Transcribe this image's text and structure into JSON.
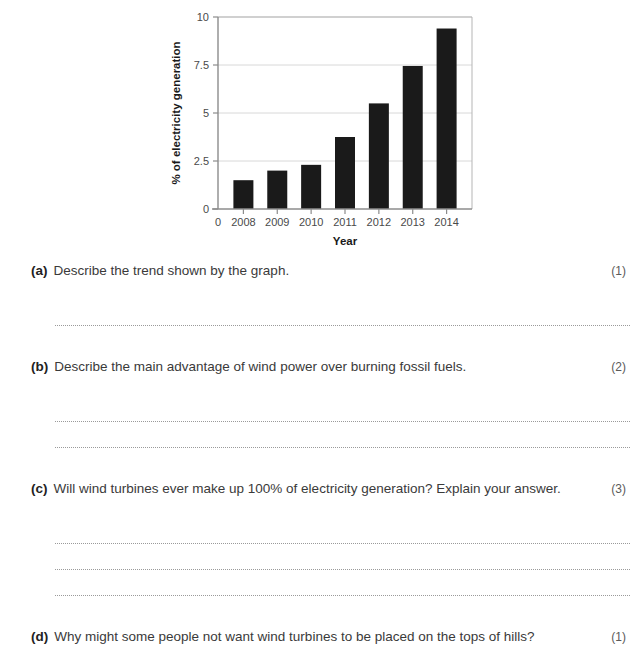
{
  "chart_data": {
    "type": "bar",
    "title": "",
    "xlabel": "Year",
    "ylabel": "% of electricity generation",
    "categories": [
      "2008",
      "2009",
      "2010",
      "2011",
      "2012",
      "2013",
      "2014"
    ],
    "values": [
      1.5,
      2.0,
      2.3,
      3.75,
      5.5,
      7.45,
      9.4
    ],
    "ylim": [
      0,
      10
    ],
    "yticks": [
      "0",
      "2.5",
      "5",
      "7.5",
      "10"
    ],
    "ytick_values": [
      0,
      2.5,
      5,
      7.5,
      10
    ],
    "x_origin_label": "0",
    "grid": true,
    "legend": "none",
    "bar_color": "#1a1a1a"
  },
  "questions": [
    {
      "letter": "(a)",
      "text": "Describe the trend shown by the graph.",
      "marks": "(1)",
      "lines": 1
    },
    {
      "letter": "(b)",
      "text": "Describe the main advantage of wind power over burning fossil fuels.",
      "marks": "(2)",
      "lines": 2
    },
    {
      "letter": "(c)",
      "text": "Will wind turbines ever make up 100% of electricity generation? Explain your answer.",
      "marks": "(3)",
      "lines": 3
    },
    {
      "letter": "(d)",
      "text": "Why might some people not want wind turbines to be placed on the tops of hills?",
      "marks": "(1)",
      "lines": 0
    }
  ]
}
